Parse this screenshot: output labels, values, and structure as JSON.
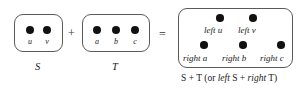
{
  "figure": {
    "type": "set-sum-diagram",
    "background": "#ffffff",
    "ink": "#1a1a1a",
    "box_stroke": "#5a5a5a",
    "dot_color": "#111111"
  },
  "operators": {
    "plus": "+",
    "equals": "="
  },
  "sets": {
    "s": {
      "name": "S",
      "elements": [
        {
          "label": "u"
        },
        {
          "label": "v"
        }
      ]
    },
    "t": {
      "name": "T",
      "elements": [
        {
          "label": "a"
        },
        {
          "label": "b"
        },
        {
          "label": "c"
        }
      ]
    },
    "result": {
      "top_row": [
        {
          "label": "left u"
        },
        {
          "label": "left v"
        }
      ],
      "bottom_row": [
        {
          "label": "right a"
        },
        {
          "label": "right b"
        },
        {
          "label": "right c"
        }
      ],
      "caption": {
        "lead": "S + T (or ",
        "italic_mid": "left",
        "mid": " S + ",
        "italic_end": "right",
        "tail": " T)",
        "full": "S + T (or left S + right T)"
      }
    }
  }
}
